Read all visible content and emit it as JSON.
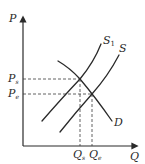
{
  "diagram": {
    "type": "supply-demand",
    "axes": {
      "y_label": "P",
      "x_label": "Q"
    },
    "curves": [
      {
        "id": "S1",
        "label": "S",
        "subscript": "1"
      },
      {
        "id": "S",
        "label": "S",
        "subscript": ""
      },
      {
        "id": "D",
        "label": "D",
        "subscript": ""
      }
    ],
    "price_levels": [
      {
        "label": "P",
        "subscript": "s"
      },
      {
        "label": "P",
        "subscript": "e"
      }
    ],
    "quantity_levels": [
      {
        "label": "Q",
        "subscript": "s"
      },
      {
        "label": "Q",
        "subscript": "e"
      }
    ],
    "colors": {
      "line": "#2a2a2a",
      "background": "#ffffff"
    }
  }
}
